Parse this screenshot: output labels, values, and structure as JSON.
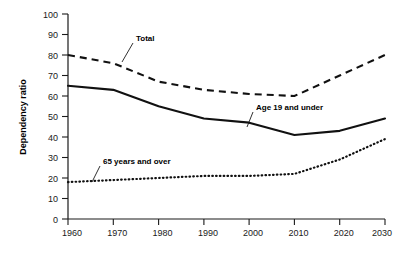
{
  "chart_data": {
    "type": "line",
    "title": "",
    "xlabel": "",
    "ylabel": "Dependency ratio",
    "x": [
      1960,
      1970,
      1980,
      1990,
      2000,
      2010,
      2020,
      2030
    ],
    "xticklabels": [
      "1960",
      "1970",
      "1980",
      "1990",
      "2000",
      "2010",
      "2020",
      "2030"
    ],
    "yticklabels": [
      "0",
      "10",
      "20",
      "30",
      "40",
      "50",
      "60",
      "70",
      "80",
      "90",
      "100"
    ],
    "ylim": [
      0,
      100
    ],
    "xlim": [
      1960,
      2030
    ],
    "ytick_step": 10,
    "grid": false,
    "legend_position": "inline-annotations",
    "series": [
      {
        "name": "Total",
        "style": "dashed",
        "values": [
          80,
          76,
          67,
          63,
          61,
          60,
          70,
          80
        ]
      },
      {
        "name": "Age 19 and under",
        "style": "solid",
        "values": [
          65,
          63,
          55,
          49,
          47,
          41,
          43,
          49
        ]
      },
      {
        "name": "65 years and over",
        "style": "dotted",
        "values": [
          18,
          19,
          20,
          21,
          21,
          22,
          29,
          39
        ]
      }
    ],
    "annotations": [
      {
        "text": "Total",
        "series": "Total"
      },
      {
        "text": "Age 19 and under",
        "series": "Age 19 and under"
      },
      {
        "text": "65 years and over",
        "series": "65 years and over"
      }
    ]
  }
}
